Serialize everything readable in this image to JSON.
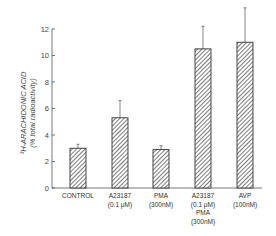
{
  "chart_data": {
    "type": "bar",
    "title": "",
    "xlabel": "",
    "ylabel": "³H-ARACHIDONIC ACID",
    "ylabel_sub": "(% total radioactivity)",
    "ylim": [
      0,
      12
    ],
    "yticks": [
      0,
      2,
      4,
      6,
      8,
      10,
      12
    ],
    "grid": false,
    "legend": null,
    "categories": [
      [
        "CONTROL"
      ],
      [
        "A23187",
        "(0.1 μM)"
      ],
      [
        "PMA",
        "(300nM)"
      ],
      [
        "A23187",
        "(0.1 μM)",
        "PMA",
        "(300nM)"
      ],
      [
        "AVP",
        "(100nM)"
      ]
    ],
    "values": [
      3.0,
      5.3,
      2.9,
      10.5,
      11.0
    ],
    "error_upper": [
      0.3,
      1.3,
      0.3,
      1.7,
      2.6
    ],
    "bar_fill": "diagonal-hatch",
    "colors": {
      "bar_stroke": "#333333",
      "hatch": "#444444",
      "axis": "#555555"
    }
  }
}
